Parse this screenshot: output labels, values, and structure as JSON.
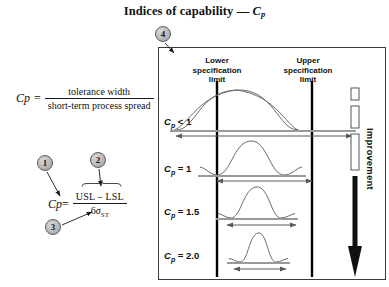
{
  "title": {
    "text": "Indices of capability",
    "dash": "—",
    "symbol": "C",
    "symbol_sub": "p"
  },
  "callouts": [
    {
      "id": "1",
      "label": "1"
    },
    {
      "id": "2",
      "label": "2"
    },
    {
      "id": "3",
      "label": "3"
    },
    {
      "id": "4",
      "label": "4"
    }
  ],
  "formula_definition": {
    "lhs": "C",
    "lhs_sub": "p",
    "equals": "=",
    "numerator": "tolerance width",
    "denominator": "short-term process spread"
  },
  "formula_expanded": {
    "lhs": "C",
    "lhs_sub": "p",
    "equals": "=",
    "numerator": "USL – LSL",
    "denominator_prefix": "6",
    "denominator_sigma": "σ",
    "denominator_sub": "ST"
  },
  "panel": {
    "lower_limit_label": "Lower\nspecification\nlimit",
    "lower_limit_lines": [
      "Lower",
      "specification",
      "limit"
    ],
    "upper_limit_lines": [
      "Upper",
      "specification",
      "limit"
    ],
    "improvement_label": "Improvement",
    "rows": [
      {
        "cp_symbol": "C",
        "cp_sub": "p",
        "relation": "< 1",
        "cp_value": "< 1",
        "spread_wider_than_spec": true
      },
      {
        "cp_symbol": "C",
        "cp_sub": "p",
        "relation": "= 1",
        "cp_value": "= 1",
        "spread_wider_than_spec": false
      },
      {
        "cp_symbol": "C",
        "cp_sub": "p",
        "relation": "= 1.5",
        "cp_value": "= 1.5",
        "spread_wider_than_spec": false
      },
      {
        "cp_symbol": "C",
        "cp_sub": "p",
        "relation": "= 2.0",
        "cp_value": "= 2.0",
        "spread_wider_than_spec": false
      }
    ]
  },
  "colors": {
    "ink": "#111111",
    "panel_border": "#3a3a3a",
    "spec_line": "#000000",
    "curve": "#555555",
    "spread_arrow": "#5a5a5a",
    "bubble_fill": "#bdbdbd"
  }
}
